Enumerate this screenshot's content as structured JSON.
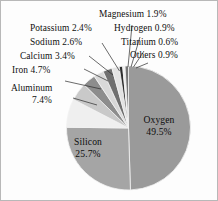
{
  "chart_data": {
    "type": "pie",
    "title": "",
    "subtitle": "",
    "xlabel": "",
    "ylabel": "",
    "legend_position": "callout-labels",
    "grid": false,
    "units": "percent",
    "start_angle_deg": 0,
    "direction": "clockwise",
    "categories": [
      "Oxygen",
      "Silicon",
      "Aluminum",
      "Iron",
      "Calcium",
      "Sodium",
      "Potassium",
      "Magnesium",
      "Hydrogen",
      "Titanium",
      "Others"
    ],
    "values": [
      49.5,
      25.7,
      7.4,
      4.7,
      3.4,
      2.6,
      2.4,
      1.9,
      0.9,
      0.6,
      0.9
    ],
    "slices": [
      {
        "name": "Oxygen",
        "value": 49.5,
        "label": "Oxygen 49.5%",
        "color": "#9a9a9a",
        "label_placement": "inside"
      },
      {
        "name": "Silicon",
        "value": 25.7,
        "label": "Silicon 25.7%",
        "color": "#a5a5a5",
        "label_placement": "inside"
      },
      {
        "name": "Aluminum",
        "value": 7.4,
        "label": "Aluminum 7.4%",
        "color": "#efefef",
        "label_placement": "callout"
      },
      {
        "name": "Iron",
        "value": 4.7,
        "label": "Iron 4.7%",
        "color": "#c9c9c9",
        "label_placement": "callout"
      },
      {
        "name": "Calcium",
        "value": 3.4,
        "label": "Calcium 3.4%",
        "color": "#8d8d8d",
        "label_placement": "callout"
      },
      {
        "name": "Sodium",
        "value": 2.6,
        "label": "Sodium 2.6%",
        "color": "#d8d8d8",
        "label_placement": "callout"
      },
      {
        "name": "Potassium",
        "value": 2.4,
        "label": "Potassium 2.4%",
        "color": "#6f6f6f",
        "label_placement": "callout"
      },
      {
        "name": "Magnesium",
        "value": 1.9,
        "label": "Magnesium 1.9%",
        "color": "#e3e3e3",
        "label_placement": "callout"
      },
      {
        "name": "Hydrogen",
        "value": 0.9,
        "label": "Hydrogen 0.9%",
        "color": "#2e2e2e",
        "label_placement": "callout"
      },
      {
        "name": "Titanium",
        "value": 0.6,
        "label": "Titanium 0.6%",
        "color": "#efefef",
        "label_placement": "callout"
      },
      {
        "name": "Others",
        "value": 0.9,
        "label": "Others 0.9%",
        "color": "#767676",
        "label_placement": "callout"
      }
    ]
  },
  "labels": {
    "oxygen_name": "Oxygen",
    "oxygen_value": "49.5%",
    "silicon_name": "Silicon",
    "silicon_value": "25.7%",
    "aluminum_name": "Aluminum",
    "aluminum_value": "7.4%",
    "iron": "Iron 4.7%",
    "calcium": "Calcium 3.4%",
    "sodium": "Sodium 2.6%",
    "potassium": "Potassium 2.4%",
    "magnesium": "Magnesium 1.9%",
    "hydrogen": "Hydrogen 0.9%",
    "titanium": "Titanium 0.6%",
    "others": "Others 0.9%"
  },
  "colors": {
    "background": "#fdfdfd",
    "border": "#b8b8b8",
    "text": "#101010",
    "slice_outline": "#f2f2f2",
    "leader_line": "#2b2b2b"
  }
}
